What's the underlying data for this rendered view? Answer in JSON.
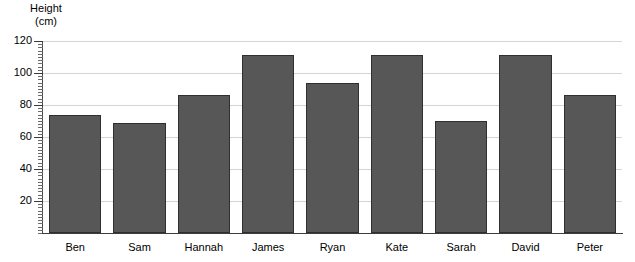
{
  "chart_data": {
    "type": "bar",
    "title": "",
    "subtitle": "",
    "xlabel": "",
    "ylabel": "Height (cm)",
    "ylabel_lines": [
      "Height",
      "(cm)"
    ],
    "categories": [
      "Ben",
      "Sam",
      "Hannah",
      "James",
      "Ryan",
      "Kate",
      "Sarah",
      "David",
      "Peter"
    ],
    "values": [
      74,
      69,
      86,
      111,
      94,
      111,
      70,
      111,
      86
    ],
    "ylim": [
      0,
      120
    ],
    "ytick_labels": [
      "20",
      "40",
      "60",
      "80",
      "100",
      "120"
    ],
    "ytick_values": [
      20,
      40,
      60,
      80,
      100,
      120
    ],
    "yminor_step": 2,
    "grid": "horizontal",
    "legend": "none",
    "bar_color": "#575757",
    "bar_border_color": "#2f2f2f",
    "gridline_color": "#d4d4d4",
    "axis_color": "#3d3d3d",
    "background_color": "#ffffff"
  }
}
